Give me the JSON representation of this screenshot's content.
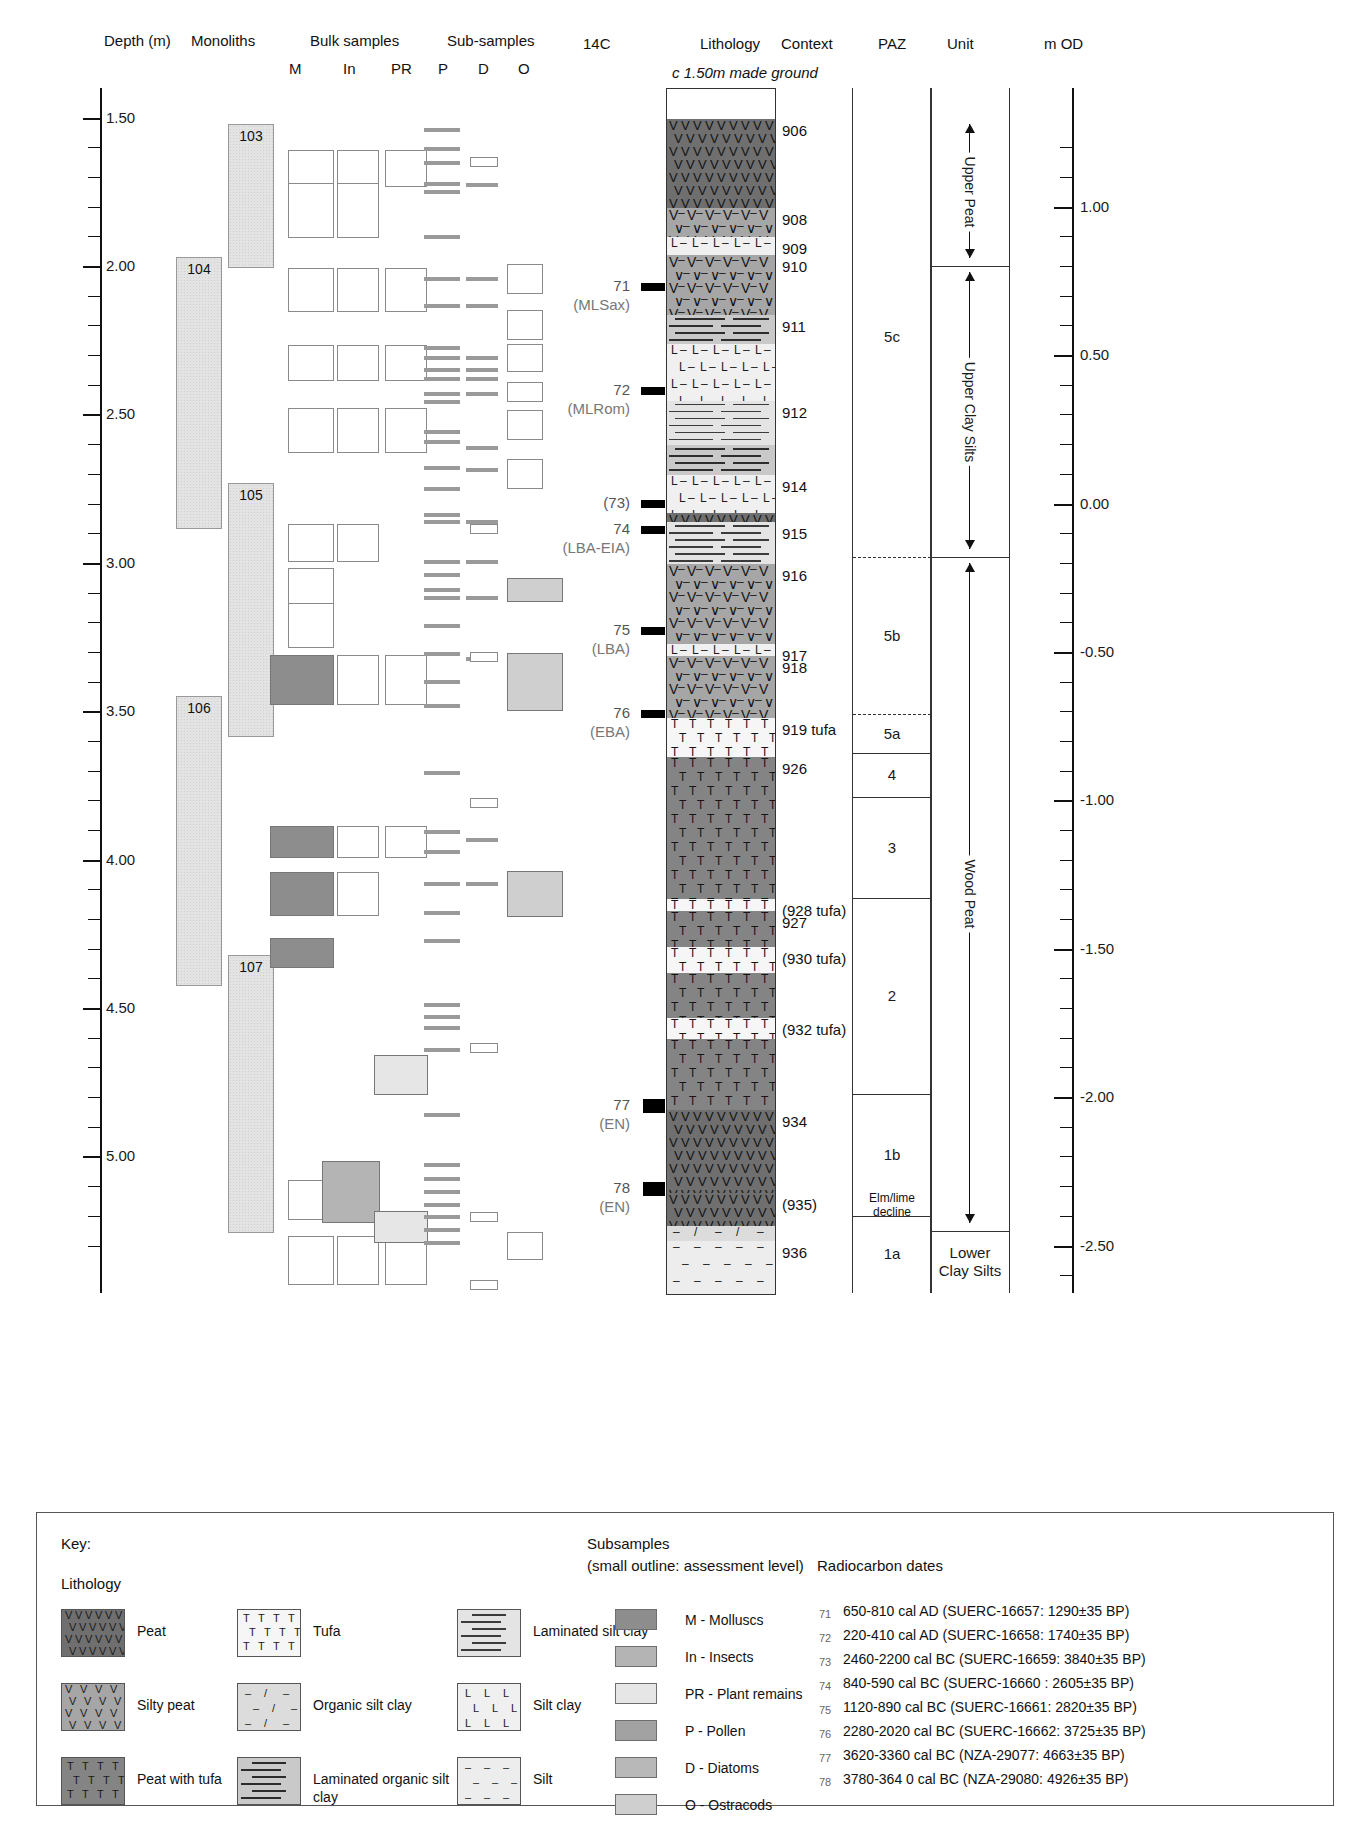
{
  "headers": {
    "depth": "Depth (m)",
    "monoliths": "Monoliths",
    "bulk_samples": "Bulk samples",
    "sub_samples": "Sub-samples",
    "c14": "14C",
    "lithology": "Lithology",
    "context": "Context",
    "paz": "PAZ",
    "unit": "Unit",
    "mod": "m OD"
  },
  "column_letters": {
    "M": "M",
    "In": "In",
    "PR": "PR",
    "P": "P",
    "D": "D",
    "O": "O"
  },
  "made_ground_note": "c 1.50m made ground",
  "chart_data": {
    "type": "table",
    "xlabel": "",
    "ylabel": "Depth (m)",
    "depth_axis": {
      "label": "Depth (m)",
      "ticks": [
        "1.50",
        "2.00",
        "2.50",
        "3.00",
        "3.50",
        "4.00",
        "4.50",
        "5.00"
      ],
      "range": [
        1.4,
        5.35
      ],
      "minor_interval": 0.1
    },
    "mod_axis": {
      "label": "m OD",
      "ticks": [
        "1.00",
        "0.50",
        "0.00",
        "-0.50",
        "-1.00",
        "-1.50",
        "-2.00",
        "-2.50"
      ],
      "range": [
        1.25,
        -2.7
      ],
      "minor_interval": 0.1
    },
    "monoliths": [
      {
        "id": "103",
        "top_m": 1.52,
        "bottom_m": 2.0
      },
      {
        "id": "104",
        "top_m": 1.97,
        "bottom_m": 2.88
      },
      {
        "id": "105",
        "top_m": 2.73,
        "bottom_m": 3.58
      },
      {
        "id": "106",
        "top_m": 3.45,
        "bottom_m": 4.42
      },
      {
        "id": "107",
        "top_m": 4.32,
        "bottom_m": 5.25
      }
    ],
    "lithology_units": [
      {
        "context": "906",
        "type": "Peat",
        "top_m": 1.5,
        "bottom_m": 1.8
      },
      {
        "context": "908",
        "type": "Silty peat",
        "top_m": 1.8,
        "bottom_m": 1.9
      },
      {
        "context": "909",
        "type": "Silt clay",
        "top_m": 1.9,
        "bottom_m": 1.96
      },
      {
        "context": "910",
        "type": "Silty peat",
        "top_m": 1.96,
        "bottom_m": 2.16
      },
      {
        "context": "911",
        "type": "Laminated organic silt clay",
        "top_m": 2.16,
        "bottom_m": 2.26
      },
      {
        "context": "",
        "type": "Silt clay",
        "top_m": 2.26,
        "bottom_m": 2.45
      },
      {
        "context": "912",
        "type": "Laminated silt clay",
        "top_m": 2.45,
        "bottom_m": 2.6
      },
      {
        "context": "",
        "type": "Laminated organic silt clay",
        "top_m": 2.6,
        "bottom_m": 2.7
      },
      {
        "context": "914",
        "type": "Silt clay",
        "top_m": 2.7,
        "bottom_m": 2.83
      },
      {
        "context": "",
        "type": "Peat",
        "top_m": 2.83,
        "bottom_m": 2.86
      },
      {
        "context": "915",
        "type": "Laminated silt clay",
        "top_m": 2.86,
        "bottom_m": 3.0
      },
      {
        "context": "916",
        "type": "Silty peat",
        "top_m": 3.0,
        "bottom_m": 3.27
      },
      {
        "context": "917",
        "type": "Silt clay",
        "top_m": 3.27,
        "bottom_m": 3.31
      },
      {
        "context": "918",
        "type": "Silty peat",
        "top_m": 3.31,
        "bottom_m": 3.52
      },
      {
        "context": "919 tufa",
        "type": "Tufa",
        "top_m": 3.52,
        "bottom_m": 3.65
      },
      {
        "context": "926",
        "type": "Peat with tufa",
        "top_m": 3.65,
        "bottom_m": 4.13
      },
      {
        "context": "(928 tufa)",
        "type": "Tufa",
        "top_m": 4.13,
        "bottom_m": 4.17
      },
      {
        "context": "927",
        "type": "Peat with tufa",
        "top_m": 4.17,
        "bottom_m": 4.29
      },
      {
        "context": "(930 tufa)",
        "type": "Tufa",
        "top_m": 4.29,
        "bottom_m": 4.38
      },
      {
        "context": "",
        "type": "Peat with tufa",
        "top_m": 4.38,
        "bottom_m": 4.53
      },
      {
        "context": "(932 tufa)",
        "type": "Tufa",
        "top_m": 4.53,
        "bottom_m": 4.6
      },
      {
        "context": "",
        "type": "Peat with tufa",
        "top_m": 4.6,
        "bottom_m": 4.84
      },
      {
        "context": "934",
        "type": "Peat",
        "top_m": 4.84,
        "bottom_m": 5.12
      },
      {
        "context": "(935)",
        "type": "Peat",
        "top_m": 5.12,
        "bottom_m": 5.23
      },
      {
        "context": "",
        "type": "Organic silt clay",
        "top_m": 5.23,
        "bottom_m": 5.28
      },
      {
        "context": "936",
        "type": "Silt",
        "top_m": 5.28,
        "bottom_m": 5.46
      }
    ],
    "paz_zones": [
      {
        "label": "5c",
        "top_m": 1.5,
        "bottom_m": 2.98
      },
      {
        "label": "5b",
        "top_m": 2.98,
        "bottom_m": 3.51
      },
      {
        "label": "5a",
        "top_m": 3.51,
        "bottom_m": 3.64
      },
      {
        "label": "4",
        "top_m": 3.64,
        "bottom_m": 3.79
      },
      {
        "label": "3",
        "top_m": 3.79,
        "bottom_m": 4.13
      },
      {
        "label": "2",
        "top_m": 4.13,
        "bottom_m": 4.79
      },
      {
        "label": "1b",
        "top_m": 4.79,
        "bottom_m": 5.2
      },
      {
        "label": "1a",
        "top_m": 5.2,
        "bottom_m": 5.46
      }
    ],
    "paz_annotation": "Elm/lime decline",
    "units": [
      {
        "label": "Upper Peat",
        "top_m": 1.5,
        "bottom_m": 2.0,
        "orientation": "vertical"
      },
      {
        "label": "Upper Clay Silts",
        "top_m": 2.0,
        "bottom_m": 2.98,
        "orientation": "vertical"
      },
      {
        "label": "Wood Peat",
        "top_m": 2.98,
        "bottom_m": 5.25,
        "orientation": "vertical"
      },
      {
        "label": "Lower Clay Silts",
        "top_m": 5.25,
        "bottom_m": 5.46,
        "orientation": "horizontal"
      }
    ],
    "c14_samples": [
      {
        "num": "71",
        "era": "(MLSax)",
        "depth_m": 2.07
      },
      {
        "num": "72",
        "era": "(MLRom)",
        "depth_m": 2.42
      },
      {
        "num": "(73)",
        "era": "",
        "depth_m": 2.8
      },
      {
        "num": "74",
        "era": "(LBA-EIA)",
        "depth_m": 2.89
      },
      {
        "num": "75",
        "era": "(LBA)",
        "depth_m": 3.23
      },
      {
        "num": "76",
        "era": "(EBA)",
        "depth_m": 3.51
      },
      {
        "num": "77",
        "era": "(EN)",
        "depth_m": 4.83
      },
      {
        "num": "78",
        "era": "(EN)",
        "depth_m": 5.11
      }
    ]
  },
  "key": {
    "title": "Key:",
    "lithology_title": "Lithology",
    "lithology_items": [
      {
        "label": "Peat",
        "fill": "peat"
      },
      {
        "label": "Silty peat",
        "fill": "siltypeat"
      },
      {
        "label": "Peat with tufa",
        "fill": "peattufa"
      },
      {
        "label": "Tufa",
        "fill": "tufa"
      },
      {
        "label": "Organic silt clay",
        "fill": "orgsiltclay"
      },
      {
        "label": "Laminated organic silt clay",
        "fill": "lamorg"
      },
      {
        "label": "Laminated silt clay",
        "fill": "lamsiltclay"
      },
      {
        "label": "Silt clay",
        "fill": "siltclay"
      },
      {
        "label": "Silt",
        "fill": "silt"
      }
    ],
    "subsamples_title": "Subsamples",
    "subsamples_note": "(small outline: assessment level)",
    "subsample_items": [
      {
        "label": "M - Molluscs",
        "color": "#8d8d8d"
      },
      {
        "label": "In - Insects",
        "color": "#b4b4b4"
      },
      {
        "label": "PR - Plant remains",
        "color": "#e6e6e6"
      },
      {
        "label": "P - Pollen",
        "color": "#a2a2a2"
      },
      {
        "label": "D - Diatoms",
        "color": "#b8b8b8"
      },
      {
        "label": "O - Ostracods",
        "color": "#cfcfcf"
      }
    ],
    "radiocarbon_title": "Radiocarbon dates",
    "radiocarbon_dates": [
      {
        "num": "71",
        "text": "650-810 cal AD (SUERC-16657: 1290±35 BP)"
      },
      {
        "num": "72",
        "text": "220-410 cal AD (SUERC-16658: 1740±35 BP)"
      },
      {
        "num": "73",
        "text": "2460-2200 cal BC (SUERC-16659: 3840±35 BP)"
      },
      {
        "num": "74",
        "text": "840-590 cal BC (SUERC-16660 : 2605±35 BP)"
      },
      {
        "num": "75",
        "text": "1120-890 cal BC (SUERC-16661: 2820±35 BP)"
      },
      {
        "num": "76",
        "text": "2280-2020 cal BC (SUERC-16662: 3725±35 BP)"
      },
      {
        "num": "77",
        "text": "3620-3360 cal BC (NZA-29077: 4663±35 BP)"
      },
      {
        "num": "78",
        "text": "3780-364 0 cal BC (NZA-29080: 4926±35 BP)"
      }
    ]
  }
}
